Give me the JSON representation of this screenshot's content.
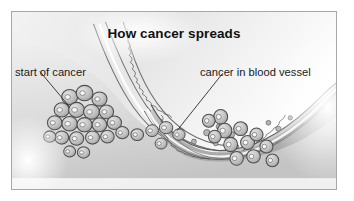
{
  "figure": {
    "title": "How cancer spreads",
    "labels": [
      {
        "id": "start-of-cancer",
        "text": "start of cancer"
      },
      {
        "id": "cancer-in-blood-vessel",
        "text": "cancer in blood vessel"
      }
    ],
    "colors": {
      "border": "#a8a8a8",
      "background": "#ffffff",
      "text": "#1a1a1a",
      "title_text": "#111111",
      "outline": "#4a4a4a",
      "tissue_light": "#e9e9e9",
      "tissue_mid": "#cfcfcf",
      "tissue_dark": "#a9a9a9",
      "cell_fill": "#bdbdbd",
      "cell_nucleus": "#f4f4f4",
      "leader_line": "#2b2b2b"
    },
    "illustration": {
      "kind": "grayscale-medical-diagram",
      "subject": "cancer cells invading tissue and entering a blood vessel",
      "elements": [
        "tumour-cell-cluster",
        "tissue-boundary",
        "blood-vessel-wall",
        "vessel-lumen",
        "cells-entering-vessel",
        "circulating-cells"
      ]
    }
  }
}
